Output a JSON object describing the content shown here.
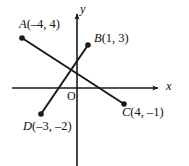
{
  "figure": {
    "kind": "cartesian-coordinate-plane-diagram",
    "background_color": "#ffffff",
    "ink_color": "#1a1a1a"
  },
  "axes": {
    "x_axis": {
      "label": "x",
      "arrow": "right",
      "pixel_y": 88,
      "pixel_x_start": 12,
      "pixel_x_end": 160
    },
    "y_axis": {
      "label": "y",
      "arrow": "up",
      "pixel_x": 77,
      "pixel_y_start": 12,
      "pixel_y_end": 166
    },
    "origin": {
      "label": "O",
      "pixel_x": 77,
      "pixel_y": 88
    }
  },
  "points": [
    {
      "id": "A",
      "name": "A",
      "coords_text": "(–4, 4)",
      "x": -4,
      "y": 4,
      "pixel_x": 22,
      "pixel_y": 38
    },
    {
      "id": "B",
      "name": "B",
      "coords_text": "(1, 3)",
      "x": 1,
      "y": 3,
      "pixel_x": 88,
      "pixel_y": 45
    },
    {
      "id": "C",
      "name": "C",
      "coords_text": "(4, –1)",
      "x": 4,
      "y": -1,
      "pixel_x": 124,
      "pixel_y": 104
    },
    {
      "id": "D",
      "name": "D",
      "coords_text": "(–3, –2)",
      "x": -3,
      "y": -2,
      "pixel_x": 41,
      "pixel_y": 114
    }
  ],
  "segments": [
    {
      "id": "AC",
      "from": "A",
      "to": "C",
      "x1": 22,
      "y1": 38,
      "x2": 124,
      "y2": 104
    },
    {
      "id": "DB",
      "from": "D",
      "to": "B",
      "x1": 41,
      "y1": 114,
      "x2": 88,
      "y2": 45
    }
  ]
}
